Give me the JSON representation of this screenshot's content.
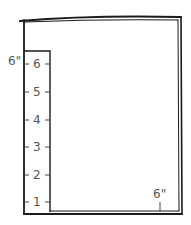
{
  "diagram": {
    "ruler": {
      "height_label": "6\"",
      "ticks": [
        "6",
        "5",
        "4",
        "3",
        "2",
        "1"
      ]
    },
    "bottom_width_label": "6\"",
    "colors": {
      "ink": "#1a1a1a",
      "label": "#555555",
      "background": "#ffffff"
    }
  }
}
